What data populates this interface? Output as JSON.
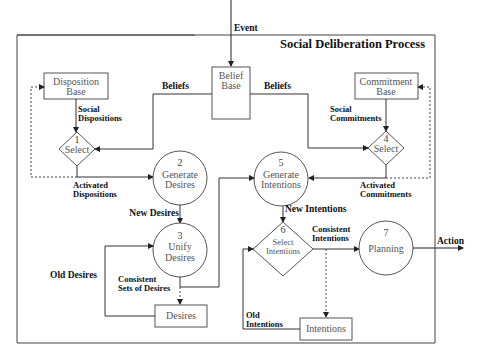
{
  "title": "Social Deliberation Process",
  "input_label": "Event",
  "output_label": "Action",
  "nodes": {
    "belief_base": {
      "line1": "Belief",
      "line2": "Base"
    },
    "disposition_base": {
      "line1": "Disposition",
      "line2": "Base"
    },
    "commitment_base": {
      "line1": "Commitment",
      "line2": "Base"
    },
    "select1": {
      "num": "1",
      "label": "Select"
    },
    "select4": {
      "num": "4",
      "label": "Select"
    },
    "generate_desires": {
      "num": "2",
      "line1": "Generate",
      "line2": "Desires"
    },
    "generate_intentions": {
      "num": "5",
      "line1": "Generate",
      "line2": "Intentions"
    },
    "unify_desires": {
      "num": "3",
      "line1": "Unify",
      "line2": "Desires"
    },
    "select_intentions": {
      "num": "6",
      "line1": "Select",
      "line2": "Intentions"
    },
    "planning": {
      "num": "7",
      "label": "Planning"
    },
    "desires": {
      "label": "Desires"
    },
    "intentions": {
      "label": "Intentions"
    }
  },
  "edge_labels": {
    "beliefs_left": "Beliefs",
    "beliefs_right": "Beliefs",
    "social_dispositions_1": "Social",
    "social_dispositions_2": "Dispositions",
    "social_commitments_1": "Social",
    "social_commitments_2": "Commitments",
    "activated_dispositions_1": "Activated",
    "activated_dispositions_2": "Dispositions",
    "activated_commitments_1": "Activated",
    "activated_commitments_2": "Commitments",
    "new_desires": "New Desires",
    "new_intentions": "New Intentions",
    "old_desires": "Old Desires",
    "consistent_sets_1": "Consistent",
    "consistent_sets_2": "Sets of Desires",
    "consistent_intentions_1": "Consistent",
    "consistent_intentions_2": "Intentions",
    "old_intentions_1": "Old",
    "old_intentions_2": "Intentions"
  }
}
